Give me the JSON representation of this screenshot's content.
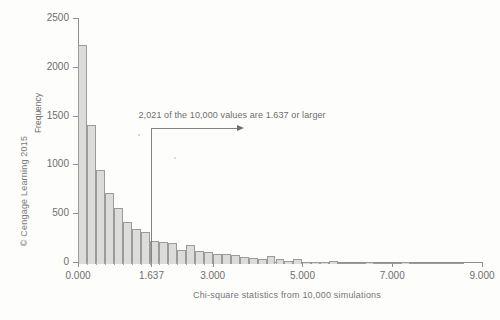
{
  "figure": {
    "copyright": "© Cengage Learning 2015",
    "copyright_icon": "copyright-icon"
  },
  "chart_data": {
    "type": "bar",
    "title": "",
    "subtitle": "",
    "xlabel": "Chi-square statistics from 10,000 simulations",
    "ylabel": "Frequency",
    "xlim": [
      0.0,
      9.0
    ],
    "ylim": [
      0,
      2500
    ],
    "grid": false,
    "legend": null,
    "bin_width": 0.2,
    "total_observations": 10000,
    "x_ticks": [
      0.0,
      1.637,
      3.0,
      5.0,
      7.0,
      9.0
    ],
    "x_tick_labels": [
      "0.000",
      "1.637",
      "3.000",
      "5.000",
      "7.000",
      "9.000"
    ],
    "y_ticks": [
      0,
      500,
      1000,
      1500,
      2000,
      2500
    ],
    "y_tick_labels": [
      "0",
      "500",
      "1000",
      "1500",
      "2000",
      "2500"
    ],
    "bin_starts": [
      0.0,
      0.2,
      0.4,
      0.6,
      0.8,
      1.0,
      1.2,
      1.4,
      1.6,
      1.8,
      2.0,
      2.2,
      2.4,
      2.6,
      2.8,
      3.0,
      3.2,
      3.4,
      3.6,
      3.8,
      4.0,
      4.2,
      4.4,
      4.6,
      4.8,
      5.0,
      5.2,
      5.4,
      5.6,
      5.8,
      6.0,
      6.2,
      6.4,
      6.6,
      6.8,
      7.0,
      7.2,
      7.4,
      7.6,
      7.8,
      8.0,
      8.2,
      8.4
    ],
    "values": [
      2240,
      1420,
      965,
      725,
      570,
      430,
      360,
      330,
      240,
      225,
      215,
      140,
      195,
      130,
      120,
      105,
      100,
      95,
      70,
      62,
      55,
      78,
      50,
      35,
      52,
      25,
      22,
      18,
      30,
      12,
      9,
      8,
      22,
      6,
      5,
      5,
      18,
      4,
      3,
      3,
      10,
      2,
      2
    ],
    "annotation": {
      "text": "2,021 of the 10,000 values are 1.637 or larger",
      "marker_value": 1.637,
      "count_at_or_above": 2021
    }
  }
}
